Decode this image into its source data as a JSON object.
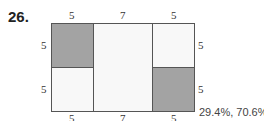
{
  "problem": {
    "number": "26.",
    "answer": "29.4%, 70.6%"
  },
  "figure": {
    "top_labels": [
      "5",
      "7",
      "5"
    ],
    "bottom_labels": [
      "5",
      "7",
      "5"
    ],
    "left_labels": [
      "5",
      "5"
    ],
    "right_labels": [
      "5",
      "5"
    ],
    "colors": {
      "shaded": "#a3a3a3",
      "unshaded": "#f8f8f8",
      "stroke": "#555555"
    },
    "regions": [
      {
        "name": "top-left",
        "shaded": true
      },
      {
        "name": "bottom-left",
        "shaded": false
      },
      {
        "name": "middle",
        "shaded": false
      },
      {
        "name": "top-right",
        "shaded": false
      },
      {
        "name": "bottom-right",
        "shaded": true
      }
    ]
  }
}
